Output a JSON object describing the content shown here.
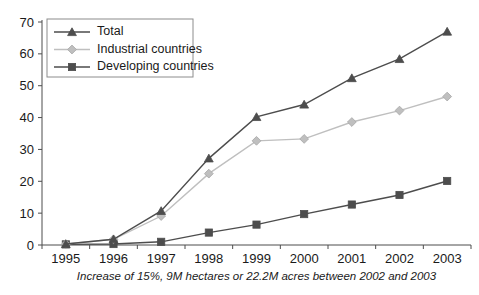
{
  "chart_data": {
    "type": "line",
    "title": "",
    "subtitle": "",
    "xlabel": "",
    "ylabel": "",
    "caption": "Increase of 15%, 9M hectares or 22.2M acres between 2002 and 2003",
    "categories": [
      "1995",
      "1996",
      "1997",
      "1998",
      "1999",
      "2000",
      "2001",
      "2002",
      "2003"
    ],
    "x_tick_labels": [
      "1995",
      "1996",
      "1997",
      "1998",
      "1999",
      "2000",
      "2001",
      "2002",
      "2003"
    ],
    "y_tick_labels": [
      "0",
      "10",
      "20",
      "30",
      "40",
      "50",
      "60",
      "70"
    ],
    "y_ticks": [
      0,
      10,
      20,
      30,
      40,
      50,
      60,
      70
    ],
    "ylim": [
      0,
      70
    ],
    "grid": false,
    "legend_position": "top-left",
    "series": [
      {
        "name": "Total",
        "values": [
          0.3,
          1.8,
          10.7,
          27.2,
          40.2,
          44.1,
          52.4,
          58.4,
          67.0
        ],
        "color": "#4d4d4d",
        "marker": "triangle"
      },
      {
        "name": "Industrial countries",
        "values": [
          0.3,
          1.8,
          9.1,
          22.4,
          32.7,
          33.3,
          38.6,
          42.2,
          46.6
        ],
        "color": "#bfbfbf",
        "marker": "diamond"
      },
      {
        "name": "Developing countries",
        "values": [
          0.2,
          0.3,
          1.0,
          3.9,
          6.4,
          9.7,
          12.7,
          15.7,
          20.1
        ],
        "color": "#4d4d4d",
        "marker": "square"
      }
    ]
  },
  "legend": {
    "entries": [
      {
        "label": "Total"
      },
      {
        "label": "Industrial countries"
      },
      {
        "label": "Developing countries"
      }
    ]
  },
  "colors": {
    "total": "#4d4d4d",
    "industrial": "#bfbfbf",
    "developing": "#4d4d4d",
    "axis": "#4d4d4d",
    "background": "#ffffff",
    "text": "#1a1a1a"
  }
}
